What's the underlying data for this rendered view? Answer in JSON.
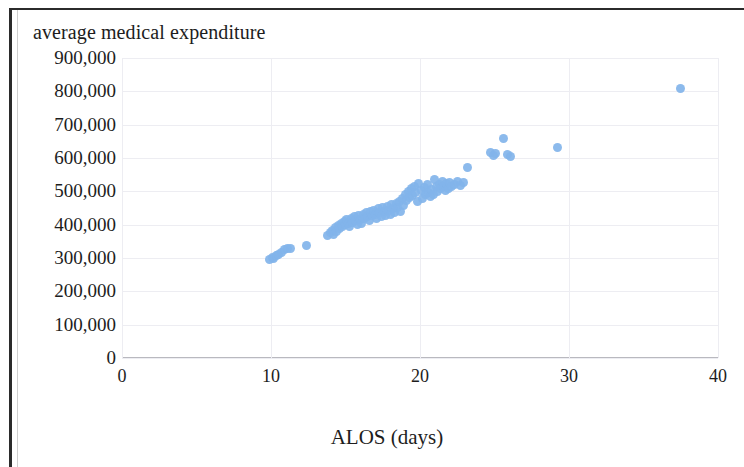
{
  "chart_data": {
    "type": "scatter",
    "title": "average medical expenditure",
    "xlabel": "ALOS (days)",
    "ylabel": "",
    "xlim": [
      0,
      40
    ],
    "ylim": [
      0,
      900000
    ],
    "xticks": [
      "0",
      "10",
      "20",
      "30",
      "40"
    ],
    "xtick_values": [
      0,
      10,
      20,
      30,
      40
    ],
    "yticks": [
      "0",
      "100,000",
      "200,000",
      "300,000",
      "400,000",
      "500,000",
      "600,000",
      "700,000",
      "800,000",
      "900,000"
    ],
    "ytick_values": [
      0,
      100000,
      200000,
      300000,
      400000,
      500000,
      600000,
      700000,
      800000,
      900000
    ],
    "grid": true,
    "legend": false,
    "marker_color": "#82b4ea",
    "series": [
      {
        "name": "hospitals",
        "points": [
          [
            9.9,
            296000
          ],
          [
            10.1,
            301000
          ],
          [
            10.2,
            299000
          ],
          [
            10.4,
            308000
          ],
          [
            10.5,
            312000
          ],
          [
            10.7,
            318000
          ],
          [
            10.9,
            325000
          ],
          [
            11.1,
            330000
          ],
          [
            11.3,
            328000
          ],
          [
            12.4,
            337000
          ],
          [
            13.8,
            368000
          ],
          [
            14.0,
            376000
          ],
          [
            14.1,
            384000
          ],
          [
            14.2,
            372000
          ],
          [
            14.3,
            392000
          ],
          [
            14.4,
            380000
          ],
          [
            14.5,
            398000
          ],
          [
            14.6,
            388000
          ],
          [
            14.7,
            404000
          ],
          [
            14.8,
            394000
          ],
          [
            14.9,
            410000
          ],
          [
            15.0,
            400000
          ],
          [
            15.1,
            415000
          ],
          [
            15.2,
            405000
          ],
          [
            15.3,
            396000
          ],
          [
            15.4,
            420000
          ],
          [
            15.5,
            408000
          ],
          [
            15.6,
            424000
          ],
          [
            15.7,
            412000
          ],
          [
            15.8,
            400000
          ],
          [
            15.9,
            428000
          ],
          [
            16.0,
            416000
          ],
          [
            16.1,
            404000
          ],
          [
            16.2,
            432000
          ],
          [
            16.3,
            420000
          ],
          [
            16.4,
            436000
          ],
          [
            16.5,
            424000
          ],
          [
            16.6,
            412000
          ],
          [
            16.7,
            440000
          ],
          [
            16.8,
            428000
          ],
          [
            16.9,
            444000
          ],
          [
            17.0,
            432000
          ],
          [
            17.1,
            420000
          ],
          [
            17.2,
            448000
          ],
          [
            17.3,
            436000
          ],
          [
            17.4,
            424000
          ],
          [
            17.5,
            452000
          ],
          [
            17.6,
            440000
          ],
          [
            17.7,
            428000
          ],
          [
            17.8,
            456000
          ],
          [
            17.9,
            444000
          ],
          [
            18.0,
            432000
          ],
          [
            18.1,
            460000
          ],
          [
            18.2,
            448000
          ],
          [
            18.3,
            436000
          ],
          [
            18.4,
            464000
          ],
          [
            18.5,
            452000
          ],
          [
            18.6,
            470000
          ],
          [
            18.7,
            440000
          ],
          [
            18.8,
            478000
          ],
          [
            18.9,
            458000
          ],
          [
            19.0,
            492000
          ],
          [
            19.1,
            472000
          ],
          [
            19.2,
            500000
          ],
          [
            19.3,
            482000
          ],
          [
            19.4,
            508000
          ],
          [
            19.5,
            488000
          ],
          [
            19.6,
            516000
          ],
          [
            19.7,
            496000
          ],
          [
            19.8,
            470000
          ],
          [
            19.9,
            524000
          ],
          [
            20.1,
            504000
          ],
          [
            20.2,
            478000
          ],
          [
            20.3,
            512000
          ],
          [
            20.4,
            490000
          ],
          [
            20.5,
            520000
          ],
          [
            20.6,
            498000
          ],
          [
            20.7,
            484000
          ],
          [
            20.8,
            506000
          ],
          [
            20.9,
            492000
          ],
          [
            21.0,
            536000
          ],
          [
            21.1,
            514000
          ],
          [
            21.2,
            500000
          ],
          [
            21.3,
            522000
          ],
          [
            21.4,
            508000
          ],
          [
            21.5,
            530000
          ],
          [
            21.6,
            516000
          ],
          [
            21.7,
            502000
          ],
          [
            21.8,
            524000
          ],
          [
            21.9,
            510000
          ],
          [
            22.0,
            528000
          ],
          [
            22.1,
            514000
          ],
          [
            22.3,
            522000
          ],
          [
            22.5,
            530000
          ],
          [
            22.7,
            518000
          ],
          [
            22.9,
            526000
          ],
          [
            23.2,
            572000
          ],
          [
            24.7,
            618000
          ],
          [
            24.9,
            608000
          ],
          [
            25.1,
            614000
          ],
          [
            25.6,
            660000
          ],
          [
            25.9,
            612000
          ],
          [
            26.1,
            606000
          ],
          [
            29.2,
            632000
          ],
          [
            37.5,
            810000
          ]
        ]
      }
    ]
  },
  "axis": {
    "x_title": "ALOS (days)"
  }
}
